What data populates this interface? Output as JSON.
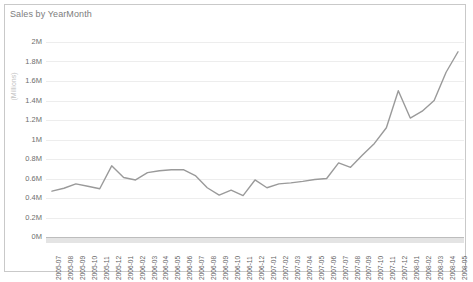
{
  "chart_title": "Sales by YearMonth",
  "chart_data": {
    "type": "line",
    "title": "Sales by YearMonth",
    "xlabel": "",
    "ylabel": "(Millions)",
    "ylim": [
      0,
      2000000
    ],
    "ytick_labels": [
      "2M",
      "1.8M",
      "1.6M",
      "1.4M",
      "1.2M",
      "1M",
      "0.8M",
      "0.6M",
      "0.4M",
      "0.2M",
      "0M"
    ],
    "ytick_values": [
      2000000,
      1800000,
      1600000,
      1400000,
      1200000,
      1000000,
      800000,
      600000,
      400000,
      200000,
      0
    ],
    "grid": true,
    "legend": "none",
    "line_color": "#9a9a9a",
    "categories": [
      "2005-07",
      "2005-08",
      "2005-09",
      "2005-10",
      "2005-11",
      "2005-12",
      "2006-01",
      "2006-02",
      "2006-03",
      "2006-04",
      "2006-05",
      "2006-06",
      "2006-07",
      "2006-08",
      "2006-09",
      "2006-10",
      "2006-11",
      "2006-12",
      "2007-01",
      "2007-02",
      "2007-03",
      "2007-04",
      "2007-05",
      "2007-06",
      "2007-07",
      "2007-08",
      "2007-09",
      "2007-10",
      "2007-11",
      "2007-12",
      "2008-01",
      "2008-02",
      "2008-03",
      "2008-04",
      "2008-05"
    ],
    "values": [
      470000,
      500000,
      545000,
      520000,
      495000,
      730000,
      610000,
      585000,
      660000,
      680000,
      690000,
      690000,
      630000,
      505000,
      430000,
      480000,
      425000,
      585000,
      505000,
      545000,
      555000,
      570000,
      590000,
      600000,
      760000,
      715000,
      840000,
      960000,
      1120000,
      1500000,
      1220000,
      1290000,
      1400000,
      1690000,
      1900000
    ]
  }
}
